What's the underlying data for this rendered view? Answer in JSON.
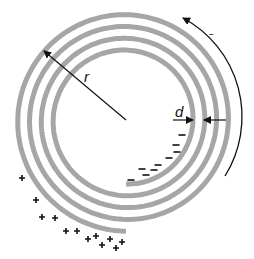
{
  "diagram": {
    "type": "spiral-charge-diagram",
    "labels": {
      "radius": "r",
      "spacing": "d",
      "rotation_sign": "–"
    },
    "colors": {
      "spiral": "#a6a6a6",
      "ink": "#111111",
      "background": "#ffffff"
    },
    "spiral": {
      "cx": 126,
      "cy": 120,
      "r_inner": 64,
      "pitch": 11.8,
      "turns": 4
    },
    "negative_charges": [
      {
        "x": 182,
        "y": 135
      },
      {
        "x": 176,
        "y": 145
      },
      {
        "x": 177,
        "y": 152
      },
      {
        "x": 169,
        "y": 158
      },
      {
        "x": 158,
        "y": 165
      },
      {
        "x": 154,
        "y": 170
      },
      {
        "x": 142,
        "y": 169
      },
      {
        "x": 146,
        "y": 175
      },
      {
        "x": 131,
        "y": 180
      }
    ],
    "positive_charges": [
      {
        "x": 22,
        "y": 178
      },
      {
        "x": 36,
        "y": 200
      },
      {
        "x": 42,
        "y": 217
      },
      {
        "x": 55,
        "y": 218
      },
      {
        "x": 66,
        "y": 231
      },
      {
        "x": 77,
        "y": 231
      },
      {
        "x": 88,
        "y": 239
      },
      {
        "x": 96,
        "y": 236
      },
      {
        "x": 102,
        "y": 245
      },
      {
        "x": 110,
        "y": 239
      },
      {
        "x": 116,
        "y": 248
      },
      {
        "x": 122,
        "y": 242
      }
    ],
    "negative_sign": "–",
    "positive_sign": "+"
  }
}
